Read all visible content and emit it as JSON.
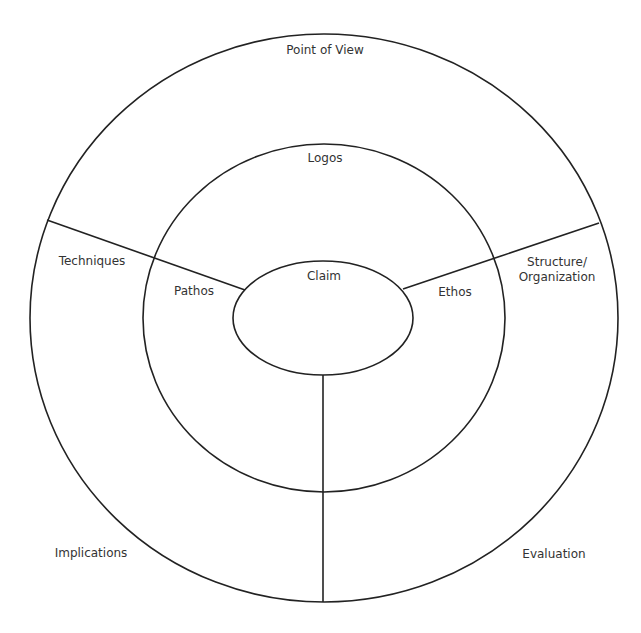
{
  "diagram": {
    "type": "rhetorical-analysis-concentric-rings",
    "colors": {
      "stroke": "#222222",
      "text": "#333333",
      "background": "#ffffff"
    },
    "rings": {
      "outer": {
        "label": "Point of View"
      },
      "middle": {
        "label": "Logos"
      },
      "center": {
        "label": "Claim"
      }
    },
    "middle_ring_sections": {
      "left": "Pathos",
      "right": "Ethos"
    },
    "outer_ring_sections": {
      "upper_left": "Techniques",
      "upper_right_line1": "Structure/",
      "upper_right_line2": "Organization",
      "lower_left": "Implications",
      "lower_right": "Evaluation"
    }
  }
}
